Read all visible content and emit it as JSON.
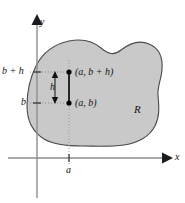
{
  "figure": {
    "colors": {
      "region_fill": "#c9c9c9",
      "region_stroke": "#4a4a4a",
      "axis": "#8e8e8e",
      "segment": "#000000",
      "dotted": "#9a9a9a",
      "text": "#141414",
      "background": "#ffffff"
    },
    "axes": {
      "y_label": "y",
      "x_label": "x",
      "origin": {
        "x": 37,
        "y": 158
      }
    },
    "ticks": {
      "y": [
        {
          "label": "b + h",
          "value_y": 72
        },
        {
          "label": "b",
          "value_y": 103
        }
      ],
      "x": [
        {
          "label": "a",
          "value_x": 69
        }
      ]
    },
    "points": [
      {
        "name": "upper-point",
        "label": "(a, b + h)",
        "x": 69,
        "y": 72
      },
      {
        "name": "lower-point",
        "label": "(a, b)",
        "x": 69,
        "y": 103
      }
    ],
    "measure": {
      "label": "h",
      "from_y": 72,
      "to_y": 103,
      "at_x": 55
    },
    "region": {
      "label": "R"
    }
  }
}
